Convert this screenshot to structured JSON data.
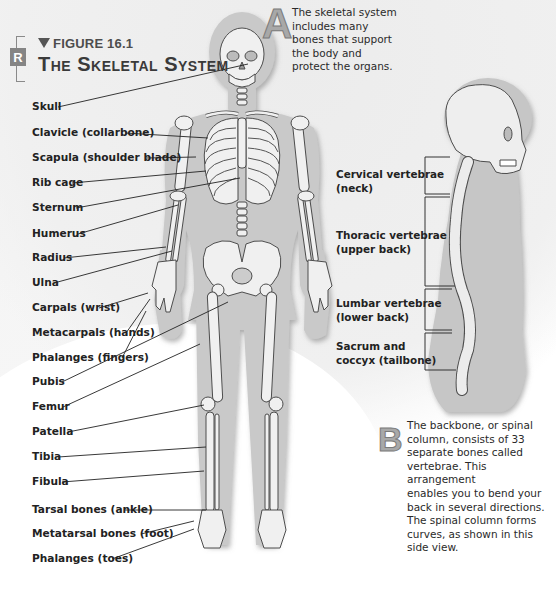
{
  "header": {
    "badge": "R",
    "figure_number": "FIGURE 16.1",
    "title": "The Skeletal System"
  },
  "caption_a": {
    "letter": "A",
    "lines": [
      "The skeletal system",
      "includes many",
      "bones that support",
      "the body and",
      "protect the organs."
    ]
  },
  "caption_b": {
    "letter": "B",
    "lines": [
      "The backbone, or spinal",
      "column, consists of 33",
      "separate bones called",
      "vertebrae. This arrangement",
      "enables you to bend your",
      "back in several directions.",
      "The spinal column forms",
      "curves, as shown in this",
      "side view."
    ]
  },
  "front_view_labels": [
    {
      "text": "Skull"
    },
    {
      "text": "Clavicle (collarbone)"
    },
    {
      "text": "Scapula (shoulder blade)"
    },
    {
      "text": "Rib cage"
    },
    {
      "text": "Sternum"
    },
    {
      "text": "Humerus"
    },
    {
      "text": "Radius"
    },
    {
      "text": "Ulna"
    },
    {
      "text": "Carpals (wrist)"
    },
    {
      "text": "Metacarpals (hands)"
    },
    {
      "text": "Phalanges (fingers)"
    },
    {
      "text": "Pubis"
    },
    {
      "text": "Femur"
    },
    {
      "text": "Patella"
    },
    {
      "text": "Tibia"
    },
    {
      "text": "Fibula"
    },
    {
      "text": "Tarsal bones (ankle)"
    },
    {
      "text": "Metatarsal bones (foot)"
    },
    {
      "text": "Phalanges (toes)"
    }
  ],
  "spine_labels": [
    {
      "line1": "Cervical vertebrae",
      "line2": "(neck)"
    },
    {
      "line1": "Thoracic vertebrae",
      "line2": "(upper back)"
    },
    {
      "line1": "Lumbar vertebrae",
      "line2": "(lower back)"
    },
    {
      "line1": "Sacrum and",
      "line2": "coccyx (tailbone)"
    }
  ],
  "colors": {
    "silhouette": "#c9c9c9",
    "bone": "#efefef",
    "bone_outline": "#555555",
    "badge": "#858585",
    "letter": "#a8a8a8"
  }
}
